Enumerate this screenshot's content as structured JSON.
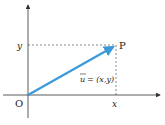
{
  "diagram": {
    "origin_label": "O",
    "point_label": "P",
    "x_label": "x",
    "y_label": "y",
    "vector_label": "u",
    "vector_eq": "= (x,y)",
    "colors": {
      "vector": "#3a9ad9",
      "axis": "#333333",
      "dashed": "#555555"
    }
  }
}
